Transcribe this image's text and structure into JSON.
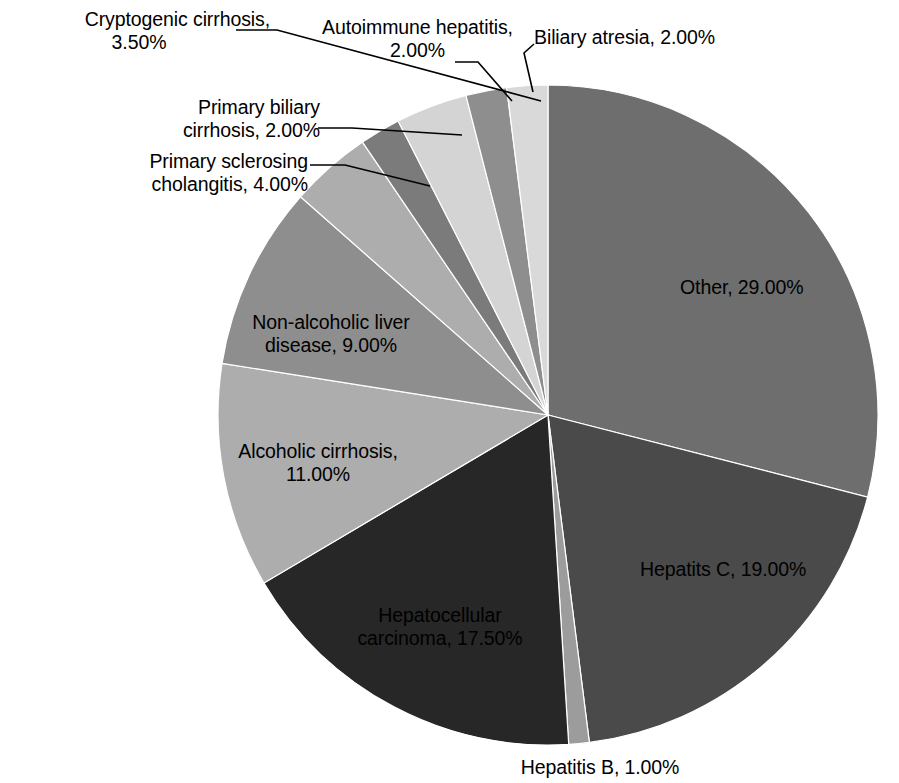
{
  "chart_data": {
    "type": "pie",
    "title": "",
    "subtitle": "",
    "xlabel": "",
    "ylabel": "",
    "legend_position": "none",
    "grid": false,
    "label_format": "{name}, {value}%",
    "start_angle_deg": 0,
    "direction": "clockwise",
    "units": "percent",
    "total": 100,
    "categories": [
      "Other",
      "Hepatits C",
      "Hepatitis B",
      "Hepatocellular carcinoma",
      "Alcoholic cirrhosis",
      "Non-alcoholic liver disease",
      "Primary sclerosing cholangitis",
      "Primary biliary cirrhosis",
      "Cryptogenic cirrhosis",
      "Autoimmune hepatitis",
      "Biliary atresia"
    ],
    "values": [
      29.0,
      19.0,
      1.0,
      17.5,
      11.0,
      9.0,
      4.0,
      2.0,
      3.5,
      2.0,
      2.0
    ],
    "value_labels": [
      "29.00%",
      "19.00%",
      "1.00%",
      "17.50%",
      "11.00%",
      "9.00%",
      "4.00%",
      "2.00%",
      "3.50%",
      "2.00%",
      "2.00%"
    ],
    "colors": [
      "#6e6e6e",
      "#4a4a4a",
      "#9c9c9c",
      "#272727",
      "#adadad",
      "#8e8e8e",
      "#adadad",
      "#7b7b7b",
      "#d4d4d4",
      "#8e8e8e",
      "#d9d9d9"
    ],
    "slices": [
      {
        "name": "Other",
        "value": 29.0,
        "label": "Other, 29.00%",
        "color": "#6e6e6e",
        "label_placement": "inside"
      },
      {
        "name": "Hepatits C",
        "value": 19.0,
        "label": "Hepatits C, 19.00%",
        "color": "#4a4a4a",
        "label_placement": "inside"
      },
      {
        "name": "Hepatitis B",
        "value": 1.0,
        "label": "Hepatitis B, 1.00%",
        "color": "#9c9c9c",
        "label_placement": "outside"
      },
      {
        "name": "Hepatocellular carcinoma",
        "value": 17.5,
        "label": "Hepatocellular carcinoma, 17.50%",
        "color": "#272727",
        "label_placement": "inside"
      },
      {
        "name": "Alcoholic cirrhosis",
        "value": 11.0,
        "label": "Alcoholic cirrhosis, 11.00%",
        "color": "#adadad",
        "label_placement": "inside"
      },
      {
        "name": "Non-alcoholic liver disease",
        "value": 9.0,
        "label": "Non-alcoholic liver disease, 9.00%",
        "color": "#8e8e8e",
        "label_placement": "inside"
      },
      {
        "name": "Primary sclerosing cholangitis",
        "value": 4.0,
        "label": "Primary sclerosing cholangitis, 4.00%",
        "color": "#adadad",
        "label_placement": "outside-leader"
      },
      {
        "name": "Primary biliary cirrhosis",
        "value": 2.0,
        "label": "Primary biliary cirrhosis, 2.00%",
        "color": "#7b7b7b",
        "label_placement": "outside-leader"
      },
      {
        "name": "Cryptogenic cirrhosis",
        "value": 3.5,
        "label": "Cryptogenic cirrhosis, 3.50%",
        "color": "#d4d4d4",
        "label_placement": "outside-leader"
      },
      {
        "name": "Autoimmune hepatitis",
        "value": 2.0,
        "label": "Autoimmune hepatitis, 2.00%",
        "color": "#8e8e8e",
        "label_placement": "outside-leader"
      },
      {
        "name": "Biliary atresia",
        "value": 2.0,
        "label": "Biliary atresia, 2.00%",
        "color": "#d9d9d9",
        "label_placement": "outside-leader"
      }
    ]
  },
  "labels": {
    "cryptogenic_line1": "Cryptogenic cirrhosis,",
    "cryptogenic_line2": "3.50%",
    "primary_biliary_line1": "Primary biliary",
    "primary_biliary_line2": "cirrhosis, 2.00%",
    "primary_sclerosing_line1": "Primary sclerosing",
    "primary_sclerosing_line2": "cholangitis, 4.00%",
    "autoimmune_line1": "Autoimmune hepatitis,",
    "autoimmune_line2": "2.00%",
    "biliary_atresia": "Biliary atresia, 2.00%",
    "other": "Other, 29.00%",
    "hepatitis_c": "Hepatits C, 19.00%",
    "hepatitis_b": "Hepatitis B, 1.00%",
    "hcc_line1": "Hepatocellular",
    "hcc_line2": "carcinoma, 17.50%",
    "alcoholic_line1": "Alcoholic cirrhosis,",
    "alcoholic_line2": "11.00%",
    "nafld_line1": "Non-alcoholic liver",
    "nafld_line2": "disease, 9.00%"
  },
  "style": {
    "background": "#ffffff",
    "text_color": "#000000",
    "leader_line_color": "#000000"
  }
}
